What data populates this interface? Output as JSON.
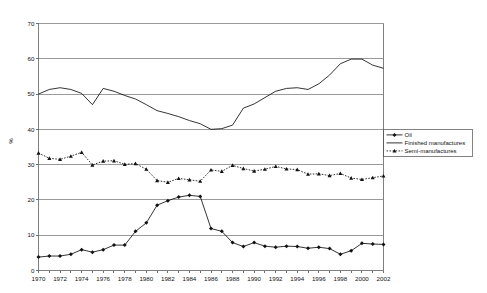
{
  "chart_data": {
    "type": "line",
    "title": "",
    "subtitle": "",
    "xlabel": "",
    "ylabel": "%",
    "xlim": [
      1970,
      2002
    ],
    "ylim": [
      0,
      70
    ],
    "y_ticks": [
      0,
      10,
      20,
      30,
      40,
      50,
      60,
      70
    ],
    "x_ticks": [
      1970,
      1972,
      1974,
      1976,
      1978,
      1980,
      1982,
      1984,
      1986,
      1988,
      1990,
      1992,
      1994,
      1996,
      1998,
      2000,
      2002
    ],
    "grid": "horizontal",
    "legend_position": "right-inside",
    "x": [
      1970,
      1971,
      1972,
      1973,
      1974,
      1975,
      1976,
      1977,
      1978,
      1979,
      1980,
      1981,
      1982,
      1983,
      1984,
      1985,
      1986,
      1987,
      1988,
      1989,
      1990,
      1991,
      1992,
      1993,
      1994,
      1995,
      1996,
      1997,
      1998,
      1999,
      2000,
      2001,
      2002
    ],
    "series": [
      {
        "name": "Oil",
        "marker": "diamond",
        "line_style": "solid",
        "values": [
          3.8,
          4.1,
          4.1,
          4.6,
          5.9,
          5.2,
          5.9,
          7.2,
          7.2,
          11.1,
          13.5,
          18.5,
          19.8,
          20.8,
          21.3,
          21.0,
          11.9,
          11.1,
          7.9,
          6.8,
          7.9,
          6.9,
          6.6,
          6.9,
          6.8,
          6.3,
          6.6,
          6.2,
          4.6,
          5.6,
          7.7,
          7.5,
          7.4
        ]
      },
      {
        "name": "Finished manufactures",
        "marker": "none",
        "line_style": "solid",
        "values": [
          50.0,
          51.3,
          51.8,
          51.3,
          50.2,
          47.0,
          51.6,
          50.8,
          49.6,
          48.6,
          47.0,
          45.3,
          44.5,
          43.6,
          42.5,
          41.6,
          40.0,
          40.2,
          41.2,
          46.0,
          47.2,
          49.0,
          50.8,
          51.6,
          51.8,
          51.3,
          52.9,
          55.4,
          58.6,
          59.9,
          59.9,
          58.2,
          57.3
        ]
      },
      {
        "name": "Semi-manufactures",
        "marker": "triangle",
        "line_style": "dashed",
        "values": [
          33.3,
          31.8,
          31.5,
          32.4,
          33.5,
          29.9,
          31.0,
          31.1,
          30.1,
          30.3,
          28.7,
          25.5,
          25.0,
          26.1,
          25.7,
          25.3,
          28.5,
          28.1,
          29.8,
          28.9,
          28.2,
          28.7,
          29.5,
          28.8,
          28.6,
          27.3,
          27.4,
          26.9,
          27.5,
          26.2,
          25.8,
          26.3,
          26.8
        ]
      }
    ]
  },
  "legend": {
    "entries": [
      {
        "label": "Oil"
      },
      {
        "label": "Finished manufactures"
      },
      {
        "label": "Semi-manufactures"
      }
    ]
  },
  "axes": {
    "y_title": "%"
  }
}
